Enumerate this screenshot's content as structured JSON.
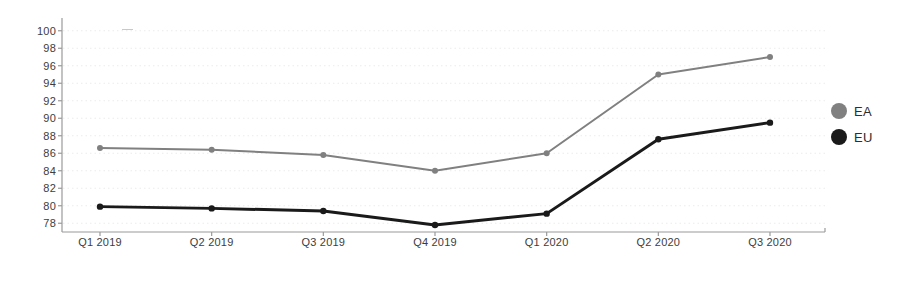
{
  "chart_data": {
    "type": "line",
    "title": "",
    "subtitle": "",
    "xlabel": "",
    "ylabel": "",
    "categories": [
      "Q1 2019",
      "Q2 2019",
      "Q3 2019",
      "Q4 2019",
      "Q1 2020",
      "Q2 2020",
      "Q3 2020"
    ],
    "series": [
      {
        "name": "EA",
        "color": "#808080",
        "values": [
          86.6,
          86.4,
          85.8,
          84.0,
          86.0,
          95.0,
          97.0
        ]
      },
      {
        "name": "EU",
        "color": "#1a1a1a",
        "values": [
          79.9,
          79.7,
          79.4,
          77.8,
          79.1,
          87.6,
          89.5
        ]
      }
    ],
    "ylim": [
      77.0,
      101.0
    ],
    "yticks": [
      78,
      80,
      82,
      84,
      86,
      88,
      90,
      92,
      94,
      96,
      98,
      100
    ],
    "ytick_labels": [
      "78",
      "80",
      "82",
      "84",
      "86",
      "88",
      "90",
      "92",
      "94",
      "96",
      "98",
      "100"
    ],
    "grid": true,
    "grid_style": "dotted",
    "grid_color": "#ebebeb",
    "axis_color": "#9a9a9a",
    "legend_position": "right",
    "markers": "circle",
    "background": "#ffffff"
  },
  "legend": {
    "entries": [
      {
        "label": "EA",
        "color": "#808080"
      },
      {
        "label": "EU",
        "color": "#1a1a1a"
      }
    ]
  }
}
